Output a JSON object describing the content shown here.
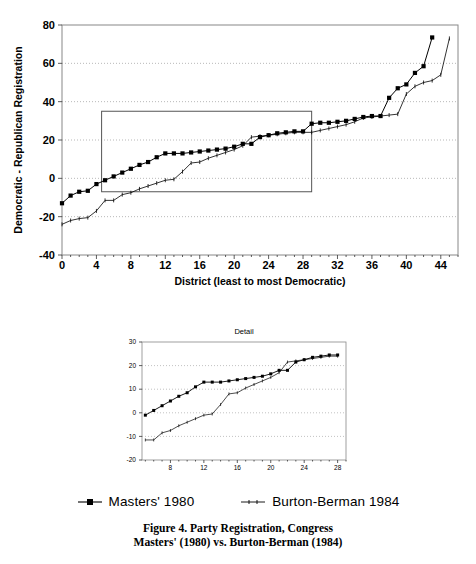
{
  "figure": {
    "caption_line1": "Figure 4. Party Registration, Congress",
    "caption_line2": "Masters' (1980) vs. Burton-Berman (1984)"
  },
  "legend": {
    "items": [
      {
        "label": "Masters' 1980",
        "marker": "square",
        "color": "#000000"
      },
      {
        "label": "Burton-Berman 1984",
        "marker": "tick",
        "color": "#000000"
      }
    ]
  },
  "chart_data": [
    {
      "id": "main",
      "type": "line",
      "title": "",
      "xlabel": "District (least to most Democratic)",
      "ylabel": "Democratic - Republican Registration",
      "xlim": [
        0,
        46
      ],
      "ylim": [
        -40,
        80
      ],
      "xticks": [
        0,
        4,
        8,
        12,
        16,
        20,
        24,
        28,
        32,
        36,
        40,
        44
      ],
      "yticks": [
        -40,
        -20,
        0,
        20,
        40,
        60,
        80
      ],
      "xtick_labels": [
        "0",
        "4",
        "8",
        "12",
        "16",
        "20",
        "24",
        "28",
        "32",
        "36",
        "40",
        "44"
      ],
      "ytick_labels": [
        "-40",
        "-20",
        "0",
        "20",
        "40",
        "60",
        "80"
      ],
      "x_minor_tick_step": 1,
      "grid": true,
      "grid_axis": "y",
      "legend_position": "below",
      "highlight_rect": {
        "x0": 4.6,
        "x1": 29.0,
        "y0": -7,
        "y1": 35
      },
      "series": [
        {
          "name": "Masters' 1980",
          "marker": "square",
          "x": [
            0,
            1,
            2,
            3,
            4,
            5,
            6,
            7,
            8,
            9,
            10,
            11,
            12,
            13,
            14,
            15,
            16,
            17,
            18,
            19,
            20,
            21,
            22,
            23,
            24,
            25,
            26,
            27,
            28,
            29,
            30,
            31,
            32,
            33,
            34,
            35,
            36,
            37,
            38,
            39,
            40,
            41,
            42,
            43
          ],
          "values": [
            -13,
            -9,
            -7,
            -6.5,
            -3,
            -1,
            1,
            3,
            5,
            7,
            8.5,
            11,
            13,
            13,
            13,
            13.5,
            14,
            14.5,
            15,
            15.5,
            16.5,
            18,
            18,
            21.5,
            22.5,
            23.5,
            24,
            24.5,
            24.5,
            28.5,
            29,
            29,
            29.5,
            30,
            31,
            32,
            32.5,
            32.5,
            42,
            47,
            49,
            55,
            58.5,
            73.5
          ]
        },
        {
          "name": "Burton-Berman 1984",
          "marker": "tick",
          "x": [
            0,
            1,
            2,
            3,
            4,
            5,
            6,
            7,
            8,
            9,
            10,
            11,
            12,
            13,
            14,
            15,
            16,
            17,
            18,
            19,
            20,
            21,
            22,
            23,
            24,
            25,
            26,
            27,
            28,
            29,
            30,
            31,
            32,
            33,
            34,
            35,
            36,
            37,
            38,
            39,
            40,
            41,
            42,
            43,
            44,
            45
          ],
          "values": [
            -24,
            -22,
            -21,
            -20.5,
            -17,
            -11.5,
            -11.5,
            -8.5,
            -7.5,
            -5.5,
            -4,
            -2.5,
            -1,
            -0.5,
            3.5,
            8,
            8.5,
            10.5,
            12,
            13.5,
            15,
            17,
            21.5,
            22,
            22.5,
            23,
            23.5,
            24,
            24,
            24,
            25,
            26,
            27,
            28,
            29.5,
            31.5,
            32,
            32.5,
            33,
            33.5,
            44,
            48,
            50,
            51,
            54,
            73
          ]
        }
      ]
    },
    {
      "id": "detail",
      "type": "line",
      "title": "Detail",
      "xlabel": "",
      "ylabel": "",
      "xlim": [
        4.6,
        29.0
      ],
      "ylim": [
        -20,
        30
      ],
      "xticks": [
        8,
        12,
        16,
        20,
        24,
        28
      ],
      "yticks": [
        -20,
        -10,
        0,
        10,
        20,
        30
      ],
      "xtick_labels": [
        "8",
        "12",
        "16",
        "20",
        "24",
        "28"
      ],
      "ytick_labels": [
        "-20",
        "-10",
        "0",
        "10",
        "20",
        "30"
      ],
      "x_minor_tick_step": 1,
      "grid": true,
      "grid_axis": "y",
      "series": [
        {
          "name": "Masters' 1980",
          "marker": "square",
          "x": [
            5,
            6,
            7,
            8,
            9,
            10,
            11,
            12,
            13,
            14,
            15,
            16,
            17,
            18,
            19,
            20,
            21,
            22,
            23,
            24,
            25,
            26,
            27,
            28
          ],
          "values": [
            -1,
            1,
            3,
            5,
            7,
            8.5,
            11,
            13,
            13,
            13,
            13.5,
            14,
            14.5,
            15,
            15.5,
            16.5,
            18,
            18,
            21.5,
            22.5,
            23.5,
            24,
            24.5,
            24.5
          ]
        },
        {
          "name": "Burton-Berman 1984",
          "marker": "tick",
          "x": [
            5,
            6,
            7,
            8,
            9,
            10,
            11,
            12,
            13,
            14,
            15,
            16,
            17,
            18,
            19,
            20,
            21,
            22,
            23,
            24,
            25,
            26,
            27,
            28
          ],
          "values": [
            -11.5,
            -11.5,
            -8.5,
            -7.5,
            -5.5,
            -4,
            -2.5,
            -1,
            -0.5,
            3.5,
            8,
            8.5,
            10.5,
            12,
            13.5,
            15,
            17,
            21.5,
            22,
            22.5,
            23,
            23.5,
            24,
            24
          ]
        }
      ]
    }
  ]
}
